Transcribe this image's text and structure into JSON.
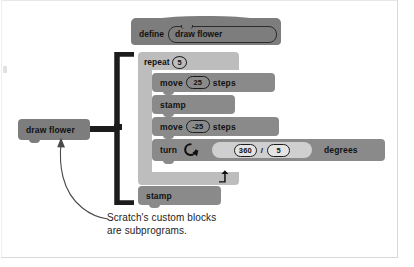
{
  "figure": {
    "kind": "scratch-program-diagram",
    "caption_lines": [
      "Scratch's custom blocks",
      "are subprograms."
    ],
    "palette": {
      "hat_block": "#7d7d7d",
      "c_block": "#bdbdbd",
      "command_block": "#8a8a8a",
      "operator_block": "#cfcfcf",
      "bracket": "#1c1c1c",
      "text": "#121212",
      "page_border": "#d8d8d8",
      "background": "#ffffff"
    }
  },
  "definition": {
    "keyword": "define",
    "procedure_name": "draw flower"
  },
  "loop": {
    "keyword": "repeat",
    "count": "5",
    "loop_arrow_icon": "loop-arrow-icon"
  },
  "body": [
    {
      "id": "move-forward",
      "label": "move",
      "value": "25",
      "suffix": "steps"
    },
    {
      "id": "stamp-1",
      "label": "stamp",
      "value": "",
      "suffix": ""
    },
    {
      "id": "move-back",
      "label": "move",
      "value": "-25",
      "suffix": "steps"
    },
    {
      "id": "turn",
      "label": "turn",
      "value": "",
      "suffix": "degrees"
    }
  ],
  "turn_block": {
    "label": "turn",
    "direction_icon": "turn-clockwise-icon",
    "operand_left": "360",
    "operator": "/",
    "operand_right": "5",
    "suffix": "degrees"
  },
  "after_loop": {
    "label": "stamp"
  },
  "caller": {
    "label": "draw flower"
  }
}
